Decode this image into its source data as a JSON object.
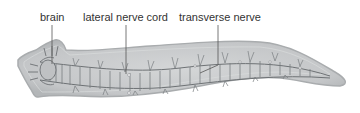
{
  "diagram": {
    "labels": [
      {
        "id": "brain",
        "text": "brain"
      },
      {
        "id": "lateral-nerve-cord",
        "text": "lateral nerve cord"
      },
      {
        "id": "transverse-nerve",
        "text": "transverse nerve"
      }
    ]
  },
  "colors": {
    "body_fill": "#c9cbcc",
    "body_edge": "#a9acae",
    "nerve": "#6e7275",
    "label_text": "#333333",
    "leader_line": "#555555"
  }
}
